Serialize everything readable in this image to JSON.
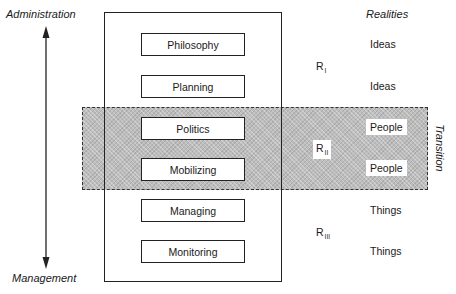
{
  "axis": {
    "top_label": "Administration",
    "bottom_label": "Management"
  },
  "realities_header": "Realities",
  "stages": [
    {
      "label": "Philosophy"
    },
    {
      "label": "Planning"
    },
    {
      "label": "Politics"
    },
    {
      "label": "Mobilizing"
    },
    {
      "label": "Managing"
    },
    {
      "label": "Monitoring"
    }
  ],
  "realities": [
    {
      "label": "Ideas"
    },
    {
      "label": "Ideas"
    },
    {
      "label": "People"
    },
    {
      "label": "People"
    },
    {
      "label": "Things"
    },
    {
      "label": "Things"
    }
  ],
  "reality_groups": [
    {
      "base": "R",
      "sub": "I"
    },
    {
      "base": "R",
      "sub": "II"
    },
    {
      "base": "R",
      "sub": "III"
    }
  ],
  "transition_label": "Transition",
  "colors": {
    "band_fill": "#bdbdbd",
    "stroke": "#222222"
  }
}
